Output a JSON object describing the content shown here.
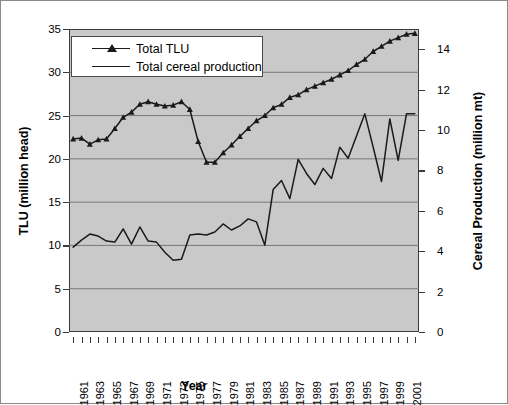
{
  "chart_data": {
    "type": "line",
    "title": "",
    "xlabel": "Year",
    "ylabel": "TLU (million head)",
    "ylabel_secondary": "Cereal Production  (million mt)",
    "ylim": [
      0,
      35
    ],
    "ylim_secondary": [
      0,
      15
    ],
    "yticks": [
      0,
      5,
      10,
      15,
      20,
      25,
      30,
      35
    ],
    "yticks_secondary": [
      0,
      2,
      4,
      6,
      8,
      10,
      12,
      14
    ],
    "grid": true,
    "grid_axis": "y",
    "legend_position": "upper-left",
    "plot_background": "#c9c9c9",
    "x": [
      1961,
      1962,
      1963,
      1964,
      1965,
      1966,
      1967,
      1968,
      1969,
      1970,
      1971,
      1972,
      1973,
      1974,
      1975,
      1976,
      1977,
      1978,
      1979,
      1980,
      1981,
      1982,
      1983,
      1984,
      1985,
      1986,
      1987,
      1988,
      1989,
      1990,
      1991,
      1992,
      1993,
      1994,
      1995,
      1996,
      1997,
      1998,
      1999,
      2000,
      2001,
      2002
    ],
    "xtick_labels": [
      "1961",
      "1963",
      "1965",
      "1967",
      "1969",
      "1971",
      "1973",
      "1975",
      "1977",
      "1979",
      "1981",
      "1983",
      "1985",
      "1987",
      "1989",
      "1991",
      "1993",
      "1995",
      "1997",
      "1999",
      "2001"
    ],
    "series": [
      {
        "name": "Total TLU",
        "axis": "left",
        "units": "million head",
        "marker": "triangle",
        "color": "#1a1a1a",
        "values": [
          22.3,
          22.4,
          21.7,
          22.2,
          22.3,
          23.5,
          24.8,
          25.4,
          26.3,
          26.6,
          26.3,
          26.1,
          26.2,
          26.6,
          25.7,
          22.0,
          19.6,
          19.6,
          20.7,
          21.6,
          22.6,
          23.5,
          24.4,
          25.0,
          25.9,
          26.3,
          27.1,
          27.4,
          28.0,
          28.4,
          28.8,
          29.2,
          29.7,
          30.2,
          30.9,
          31.5,
          32.4,
          33.0,
          33.6,
          34.0,
          34.4,
          34.5
        ]
      },
      {
        "name": "Total cereal production",
        "axis": "right",
        "units": "million mt",
        "marker": "none",
        "color": "#1a1a1a",
        "values": [
          4.2,
          4.55,
          4.85,
          4.75,
          4.5,
          4.45,
          5.1,
          4.35,
          5.2,
          4.5,
          4.45,
          3.95,
          3.55,
          3.6,
          4.8,
          4.85,
          4.8,
          4.95,
          5.35,
          5.05,
          5.25,
          5.6,
          5.45,
          4.3,
          7.05,
          7.5,
          6.6,
          8.55,
          7.85,
          7.3,
          8.1,
          7.6,
          9.15,
          8.6,
          9.7,
          10.8,
          9.15,
          7.45,
          10.55,
          8.5,
          10.8,
          10.8
        ]
      }
    ]
  },
  "axes": {
    "left_ticks": [
      "35",
      "30",
      "25",
      "20",
      "15",
      "10",
      "5",
      "0"
    ],
    "right_ticks": [
      "14",
      "12",
      "10",
      "8",
      "6",
      "4",
      "2",
      "0"
    ],
    "left_title": "TLU (million head)",
    "right_title": "Cereal Production  (million mt)",
    "x_title": "Year"
  },
  "legend": {
    "items": [
      {
        "label": "Total TLU",
        "marker": "triangle-line"
      },
      {
        "label": "Total cereal production",
        "marker": "line"
      }
    ]
  }
}
